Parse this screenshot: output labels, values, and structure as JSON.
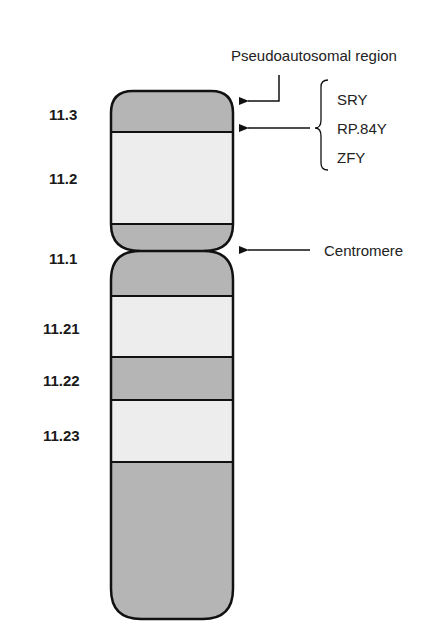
{
  "diagram": {
    "type": "chromosome-ideogram",
    "chromosome": "Y",
    "colors": {
      "dark_band": "#b5b5b5",
      "light_band": "#ededed",
      "outline": "#111111",
      "text": "#1a1a1a"
    },
    "bands": [
      {
        "label": "11.3",
        "shade": "dark",
        "arm": "p"
      },
      {
        "label": "11.2",
        "shade": "light",
        "arm": "p"
      },
      {
        "label": "11.1",
        "shade": "dark",
        "arm": "p/q centromere"
      },
      {
        "label": "11.21",
        "shade": "light",
        "arm": "q"
      },
      {
        "label": "11.22",
        "shade": "dark",
        "arm": "q"
      },
      {
        "label": "11.23",
        "shade": "light",
        "arm": "q"
      },
      {
        "label": "",
        "shade": "dark",
        "arm": "q"
      }
    ],
    "annotations": {
      "pseudoautosomal": "Pseudoautosomal region",
      "genes": [
        "SRY",
        "RP.84Y",
        "ZFY"
      ],
      "centromere": "Centromere"
    }
  }
}
